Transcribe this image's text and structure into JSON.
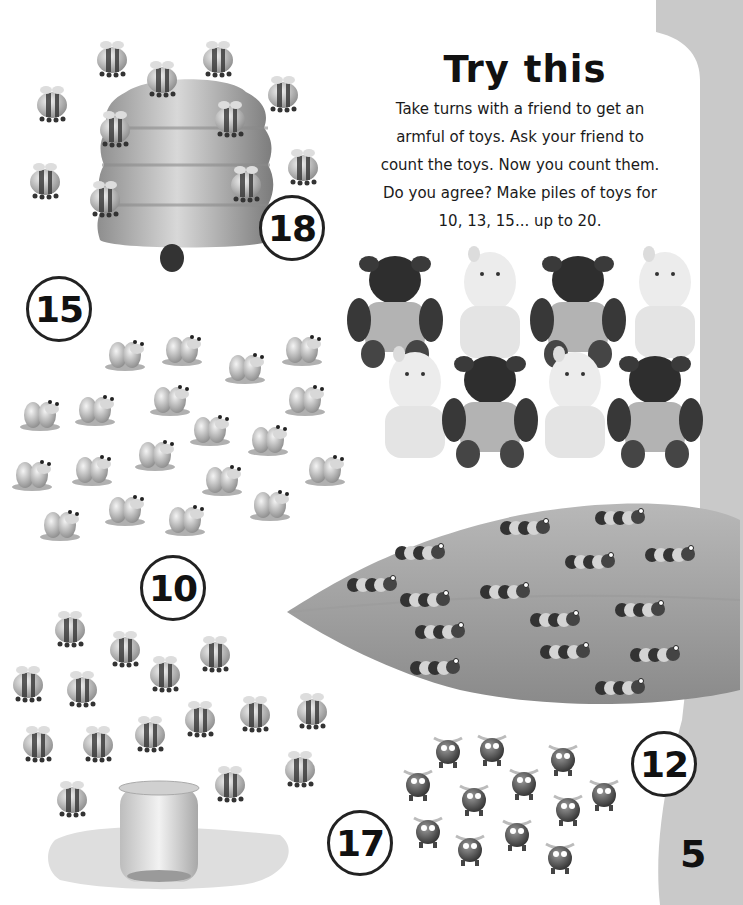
{
  "page": {
    "number": "5",
    "colors": {
      "background": "#ffffff",
      "side_panel": "#c8c8c8",
      "ink": "#111111",
      "circle_border": "#222222"
    }
  },
  "try_this": {
    "title": "Try this",
    "lines": [
      "Take turns with a friend to get an",
      "armful of toys. Ask your friend to",
      "count the toys. Now you count them.",
      "Do you agree? Make piles of toys for",
      "10, 13, 15... up to 20."
    ]
  },
  "groups": [
    {
      "id": "bees-beehive",
      "label": "18",
      "item": "bee",
      "count": 18,
      "extra": "beehive"
    },
    {
      "id": "frogs",
      "label": "15",
      "item": "frog",
      "count": 15
    },
    {
      "id": "toys",
      "label": "",
      "item": "soft toy (cow / hippo)",
      "count": 8
    },
    {
      "id": "caterpillars-leaf",
      "label": "12",
      "item": "caterpillar",
      "count": 12,
      "extra": "leaf"
    },
    {
      "id": "bees-honey-jar",
      "label": "10",
      "item": "bee",
      "count": 10,
      "extra": "honey jar"
    },
    {
      "id": "bugs",
      "label": "17",
      "item": "bug",
      "count": 17
    }
  ]
}
